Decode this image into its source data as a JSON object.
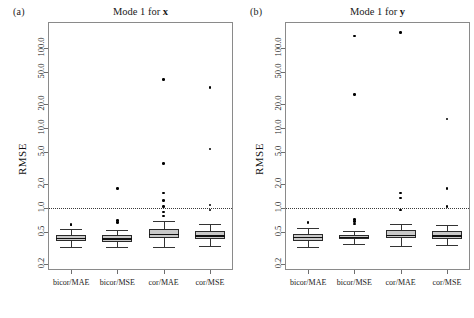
{
  "figure": {
    "panels": [
      {
        "tag": "(a)",
        "title_prefix": "Mode 1 for ",
        "title_var": "x",
        "ylabel": "RMSE"
      },
      {
        "tag": "(b)",
        "title_prefix": "Mode 1 for ",
        "title_var": "y",
        "ylabel": "RMSE"
      }
    ],
    "reference_line_value": 1.0,
    "box_fill_color": "#c9c9c9",
    "box_line_color": "#2a2a2a",
    "frame_color": "#8a8a8a"
  },
  "chart_data": {
    "type": "box",
    "xlabel": "",
    "ylabel": "RMSE",
    "yscale": "log",
    "ylim": [
      0.17,
      210
    ],
    "yticks": [
      0.2,
      0.5,
      1.0,
      2.0,
      5.0,
      10.0,
      20.0,
      50.0,
      100.0
    ],
    "ytick_labels": [
      "0.2",
      "0.5",
      "1.0",
      "2.0",
      "5.0",
      "10.0",
      "20.0",
      "50.0",
      "100.0"
    ],
    "grid": false,
    "legend": "none",
    "annotations": [
      "dotted horizontal reference line at RMSE = 1.0"
    ],
    "categories": [
      "bicor/MAE",
      "bicor/MSE",
      "cor/MAE",
      "cor/MSE"
    ],
    "panels": [
      {
        "name": "Mode 1 for x",
        "tag": "(a)",
        "boxes": [
          {
            "category": "bicor/MAE",
            "lower_whisker": 0.33,
            "q1": 0.39,
            "median": 0.43,
            "q3": 0.47,
            "upper_whisker": 0.55,
            "outliers": [
              0.62,
              0.63
            ]
          },
          {
            "category": "bicor/MSE",
            "lower_whisker": 0.33,
            "q1": 0.38,
            "median": 0.42,
            "q3": 0.46,
            "upper_whisker": 0.54,
            "outliers": [
              0.66,
              0.7,
              1.75
            ]
          },
          {
            "category": "cor/MAE",
            "lower_whisker": 0.33,
            "q1": 0.42,
            "median": 0.48,
            "q3": 0.55,
            "upper_whisker": 0.7,
            "outliers": [
              0.8,
              0.9,
              1.05,
              1.25,
              1.55,
              3.6,
              40.0
            ]
          },
          {
            "category": "cor/MSE",
            "lower_whisker": 0.34,
            "q1": 0.41,
            "median": 0.46,
            "q3": 0.52,
            "upper_whisker": 0.63,
            "outliers": [
              0.95,
              1.1,
              5.5,
              32.0
            ]
          }
        ]
      },
      {
        "name": "Mode 1 for y",
        "tag": "(b)",
        "boxes": [
          {
            "category": "bicor/MAE",
            "lower_whisker": 0.33,
            "q1": 0.39,
            "median": 0.44,
            "q3": 0.48,
            "upper_whisker": 0.56,
            "outliers": [
              0.66
            ]
          },
          {
            "category": "bicor/MSE",
            "lower_whisker": 0.36,
            "q1": 0.41,
            "median": 0.44,
            "q3": 0.47,
            "upper_whisker": 0.52,
            "outliers": [
              0.64,
              0.68,
              0.72,
              26.0,
              140.0
            ]
          },
          {
            "category": "cor/MAE",
            "lower_whisker": 0.34,
            "q1": 0.42,
            "median": 0.47,
            "q3": 0.53,
            "upper_whisker": 0.64,
            "outliers": [
              0.95,
              1.35,
              1.55,
              155.0
            ]
          },
          {
            "category": "cor/MSE",
            "lower_whisker": 0.35,
            "q1": 0.41,
            "median": 0.46,
            "q3": 0.52,
            "upper_whisker": 0.62,
            "outliers": [
              1.05,
              1.75,
              13.0
            ]
          }
        ]
      }
    ]
  }
}
